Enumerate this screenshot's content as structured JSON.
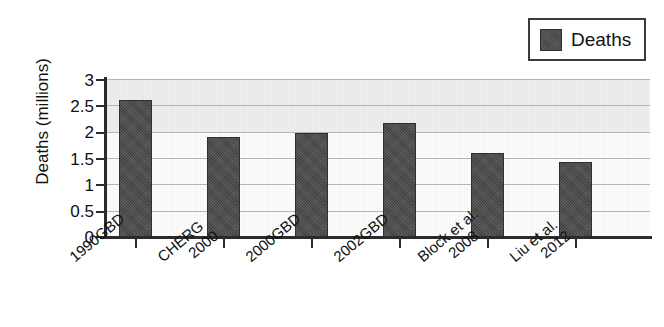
{
  "legend": {
    "entries": [
      {
        "label": "Deaths",
        "color": "#4c4c4c"
      }
    ]
  },
  "axes": {
    "ylabel": "Deaths (millions)",
    "yticks": [
      "0",
      "0.5",
      "1",
      "1.5",
      "2",
      "2.5",
      "3"
    ]
  },
  "chart_data": {
    "type": "bar",
    "title": "",
    "xlabel": "",
    "ylabel": "Deaths (millions)",
    "ylim": [
      0,
      3
    ],
    "ytick_values": [
      0,
      0.5,
      1,
      1.5,
      2,
      2.5,
      3
    ],
    "grid": true,
    "legend_position": "top-right",
    "series_name": "Deaths",
    "series_color": "#4c4c4c",
    "categories": [
      "1990GBD",
      "CHERG 2000",
      "2000GBD",
      "2002GBD",
      "Block et al. 2008",
      "Liu et al. 2012"
    ],
    "category_lines": [
      [
        "1990GBD"
      ],
      [
        "CHERG",
        "2000"
      ],
      [
        "2000GBD"
      ],
      [
        "2002GBD"
      ],
      [
        "Block et al.",
        "2008"
      ],
      [
        "Liu et al.",
        "2012"
      ]
    ],
    "values": [
      2.6,
      1.89,
      1.97,
      2.17,
      1.6,
      1.43
    ],
    "units": "millions"
  }
}
